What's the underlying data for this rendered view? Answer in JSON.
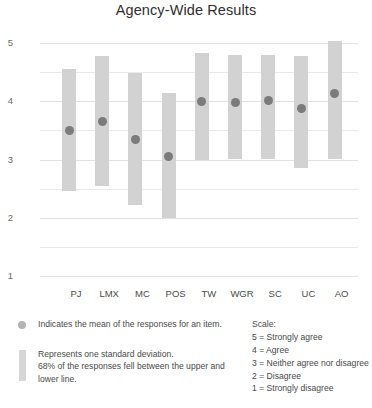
{
  "chart_data": {
    "type": "bar",
    "title": "Agency-Wide Results",
    "xlabel": "",
    "ylabel": "",
    "ylim": [
      1,
      5
    ],
    "yticks": [
      5,
      4,
      3,
      2,
      1
    ],
    "grid": true,
    "legend_position": "bottom",
    "categories": [
      "PJ",
      "LMX",
      "MC",
      "POS",
      "TW",
      "WGR",
      "SC",
      "UC",
      "AO"
    ],
    "series": [
      {
        "name": "Mean",
        "marker": "circle",
        "values": [
          3.49,
          3.66,
          3.35,
          3.06,
          3.99,
          3.97,
          4.01,
          3.87,
          4.14
        ]
      },
      {
        "name": "One standard deviation band",
        "upper": [
          4.56,
          4.78,
          4.49,
          4.15,
          4.83,
          4.79,
          4.8,
          4.78,
          5.03
        ],
        "lower": [
          2.46,
          2.55,
          2.22,
          2.0,
          2.99,
          3.01,
          3.0,
          2.85,
          3.01
        ]
      }
    ]
  },
  "axis": {
    "ytick_labels": [
      "5",
      "4",
      "3",
      "2",
      "1"
    ],
    "xtick_labels": [
      "PJ",
      "LMX",
      "MC",
      "POS",
      "TW",
      "WGR",
      "SC",
      "UC",
      "AO"
    ]
  },
  "legend": {
    "mean_text": "Indicates the mean of the responses for an item.",
    "sd_line1": "Represents one standard deviation.",
    "sd_line2": "68% of the responses fell between the upper and",
    "sd_line3": "lower line."
  },
  "scale": {
    "heading": "Scale:",
    "items": [
      "5 = Strongly agree",
      "4 = Agree",
      "3 = Neither agree nor disagree",
      "2 = Disagree",
      "1 = Strongly disagree"
    ]
  },
  "colors": {
    "bar": "#d2d2d2",
    "dot": "#7b7b7b",
    "grid": "#e9e9e9",
    "text": "#3a3a3a"
  }
}
